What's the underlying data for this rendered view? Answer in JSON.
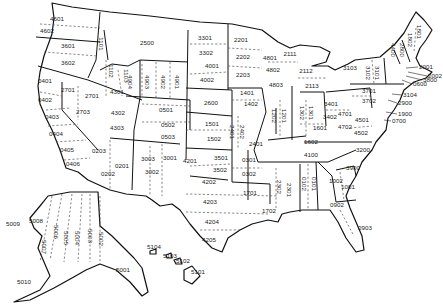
{
  "map": {
    "title": "State Plane Coordinate System Zones (FIPS codes)",
    "colors": {
      "background": "#ffffff",
      "boundary": "#111111",
      "zone_line": "#555555",
      "label": "#222222"
    },
    "zones": [
      {
        "code": "4601",
        "x": 57,
        "y": 19
      },
      {
        "code": "4602",
        "x": 47,
        "y": 31
      },
      {
        "code": "3601",
        "x": 68,
        "y": 46
      },
      {
        "code": "3602",
        "x": 68,
        "y": 63
      },
      {
        "code": "1101",
        "x": 101,
        "y": 44,
        "rot": true
      },
      {
        "code": "1102",
        "x": 111,
        "y": 71,
        "rot": true
      },
      {
        "code": "1103",
        "x": 126,
        "y": 76,
        "rot": true
      },
      {
        "code": "2500",
        "x": 147,
        "y": 43
      },
      {
        "code": "3301",
        "x": 205,
        "y": 38
      },
      {
        "code": "3302",
        "x": 206,
        "y": 53
      },
      {
        "code": "4001",
        "x": 212,
        "y": 66
      },
      {
        "code": "4002",
        "x": 207,
        "y": 80
      },
      {
        "code": "2201",
        "x": 241,
        "y": 40
      },
      {
        "code": "2202",
        "x": 243,
        "y": 57
      },
      {
        "code": "2203",
        "x": 243,
        "y": 75
      },
      {
        "code": "4801",
        "x": 270,
        "y": 58
      },
      {
        "code": "4802",
        "x": 273,
        "y": 70
      },
      {
        "code": "4803",
        "x": 276,
        "y": 85
      },
      {
        "code": "2111",
        "x": 290,
        "y": 54
      },
      {
        "code": "2112",
        "x": 306,
        "y": 71
      },
      {
        "code": "2113",
        "x": 312,
        "y": 86
      },
      {
        "code": "4904",
        "x": 130,
        "y": 82,
        "rot": true
      },
      {
        "code": "4903",
        "x": 147,
        "y": 82,
        "rot": true
      },
      {
        "code": "4902",
        "x": 163,
        "y": 82,
        "rot": true
      },
      {
        "code": "4901",
        "x": 177,
        "y": 82,
        "rot": true
      },
      {
        "code": "0401",
        "x": 45,
        "y": 81
      },
      {
        "code": "2701",
        "x": 68,
        "y": 90
      },
      {
        "code": "2701",
        "x": 92,
        "y": 96
      },
      {
        "code": "4301",
        "x": 117,
        "y": 92
      },
      {
        "code": "0402",
        "x": 45,
        "y": 100
      },
      {
        "code": "2703",
        "x": 83,
        "y": 112
      },
      {
        "code": "0403",
        "x": 52,
        "y": 117
      },
      {
        "code": "4302",
        "x": 118,
        "y": 113
      },
      {
        "code": "4303",
        "x": 117,
        "y": 128
      },
      {
        "code": "0404",
        "x": 56,
        "y": 134
      },
      {
        "code": "0405",
        "x": 67,
        "y": 150
      },
      {
        "code": "0406",
        "x": 73,
        "y": 164
      },
      {
        "code": "0203",
        "x": 99,
        "y": 151
      },
      {
        "code": "0201",
        "x": 122,
        "y": 166
      },
      {
        "code": "0202",
        "x": 108,
        "y": 174
      },
      {
        "code": "0501",
        "x": 166,
        "y": 110
      },
      {
        "code": "0502",
        "x": 168,
        "y": 125
      },
      {
        "code": "0503",
        "x": 168,
        "y": 137
      },
      {
        "code": "2600",
        "x": 211,
        "y": 103
      },
      {
        "code": "1401",
        "x": 247,
        "y": 93
      },
      {
        "code": "1402",
        "x": 251,
        "y": 104
      },
      {
        "code": "1501",
        "x": 212,
        "y": 124
      },
      {
        "code": "1502",
        "x": 214,
        "y": 139
      },
      {
        "code": "3001",
        "x": 170,
        "y": 158
      },
      {
        "code": "3003",
        "x": 148,
        "y": 159
      },
      {
        "code": "3002",
        "x": 152,
        "y": 172
      },
      {
        "code": "4201",
        "x": 190,
        "y": 161
      },
      {
        "code": "3501",
        "x": 221,
        "y": 158
      },
      {
        "code": "3502",
        "x": 220,
        "y": 170
      },
      {
        "code": "4202",
        "x": 209,
        "y": 182
      },
      {
        "code": "4203",
        "x": 210,
        "y": 202
      },
      {
        "code": "4204",
        "x": 212,
        "y": 222
      },
      {
        "code": "4205",
        "x": 209,
        "y": 240
      },
      {
        "code": "2401",
        "x": 232,
        "y": 132,
        "rot": true
      },
      {
        "code": "2402",
        "x": 242,
        "y": 132,
        "rot": true
      },
      {
        "code": "2401",
        "x": 256,
        "y": 144
      },
      {
        "code": "1202",
        "x": 274,
        "y": 116,
        "rot": true
      },
      {
        "code": "1201",
        "x": 284,
        "y": 116,
        "rot": true
      },
      {
        "code": "1302",
        "x": 302,
        "y": 113,
        "rot": true
      },
      {
        "code": "1301",
        "x": 311,
        "y": 113,
        "rot": true
      },
      {
        "code": "3401",
        "x": 331,
        "y": 104
      },
      {
        "code": "3402",
        "x": 330,
        "y": 117
      },
      {
        "code": "1601",
        "x": 320,
        "y": 128
      },
      {
        "code": "1602",
        "x": 311,
        "y": 142
      },
      {
        "code": "4701",
        "x": 345,
        "y": 114
      },
      {
        "code": "4702",
        "x": 345,
        "y": 127
      },
      {
        "code": "4501",
        "x": 362,
        "y": 120
      },
      {
        "code": "4502",
        "x": 361,
        "y": 133
      },
      {
        "code": "3701",
        "x": 369,
        "y": 91
      },
      {
        "code": "3702",
        "x": 369,
        "y": 101
      },
      {
        "code": "4100",
        "x": 311,
        "y": 155
      },
      {
        "code": "0301",
        "x": 249,
        "y": 160
      },
      {
        "code": "0302",
        "x": 249,
        "y": 174
      },
      {
        "code": "1701",
        "x": 250,
        "y": 193
      },
      {
        "code": "1702",
        "x": 269,
        "y": 211
      },
      {
        "code": "2302",
        "x": 279,
        "y": 187,
        "rot": true
      },
      {
        "code": "2301",
        "x": 289,
        "y": 190,
        "rot": true
      },
      {
        "code": "0102",
        "x": 304,
        "y": 184,
        "rot": true
      },
      {
        "code": "0101",
        "x": 314,
        "y": 184,
        "rot": true
      },
      {
        "code": "1002",
        "x": 336,
        "y": 181
      },
      {
        "code": "1001",
        "x": 348,
        "y": 187
      },
      {
        "code": "3200",
        "x": 363,
        "y": 150
      },
      {
        "code": "3900",
        "x": 353,
        "y": 168
      },
      {
        "code": "0902",
        "x": 337,
        "y": 205
      },
      {
        "code": "0903",
        "x": 365,
        "y": 228
      },
      {
        "code": "3103",
        "x": 350,
        "y": 68
      },
      {
        "code": "3102",
        "x": 368,
        "y": 73,
        "rot": true
      },
      {
        "code": "3101",
        "x": 377,
        "y": 73,
        "rot": true
      },
      {
        "code": "4400",
        "x": 393,
        "y": 50,
        "rot": true
      },
      {
        "code": "2800",
        "x": 402,
        "y": 50,
        "rot": true
      },
      {
        "code": "1802",
        "x": 410,
        "y": 40,
        "rot": true
      },
      {
        "code": "1801",
        "x": 419,
        "y": 32,
        "rot": true
      },
      {
        "code": "2001",
        "x": 419,
        "y": 67,
        "lead": true
      },
      {
        "code": "2002",
        "x": 428,
        "y": 76,
        "lead": true
      },
      {
        "code": "3800",
        "x": 423,
        "y": 80,
        "lead": true
      },
      {
        "code": "0600",
        "x": 413,
        "y": 84,
        "lead": true
      },
      {
        "code": "3104",
        "x": 403,
        "y": 95,
        "lead": true
      },
      {
        "code": "2900",
        "x": 398,
        "y": 103,
        "lead": true
      },
      {
        "code": "1900",
        "x": 398,
        "y": 114,
        "lead": true
      },
      {
        "code": "0700",
        "x": 392,
        "y": 121,
        "lead": true
      },
      {
        "code": "5008",
        "x": 36,
        "y": 221
      },
      {
        "code": "5009",
        "x": 13,
        "y": 224
      },
      {
        "code": "5007",
        "x": 44,
        "y": 247,
        "rot": true
      },
      {
        "code": "5006",
        "x": 56,
        "y": 232,
        "rot": true
      },
      {
        "code": "5005",
        "x": 66,
        "y": 238,
        "rot": true
      },
      {
        "code": "5004",
        "x": 77,
        "y": 238,
        "rot": true
      },
      {
        "code": "5003",
        "x": 90,
        "y": 236,
        "rot": true
      },
      {
        "code": "5002",
        "x": 101,
        "y": 239,
        "rot": true
      },
      {
        "code": "5001",
        "x": 123,
        "y": 270
      },
      {
        "code": "5010",
        "x": 24,
        "y": 282
      },
      {
        "code": "5104",
        "x": 154,
        "y": 247
      },
      {
        "code": "5103",
        "x": 170,
        "y": 256
      },
      {
        "code": "5102",
        "x": 183,
        "y": 261
      },
      {
        "code": "5101",
        "x": 198,
        "y": 272
      }
    ]
  }
}
